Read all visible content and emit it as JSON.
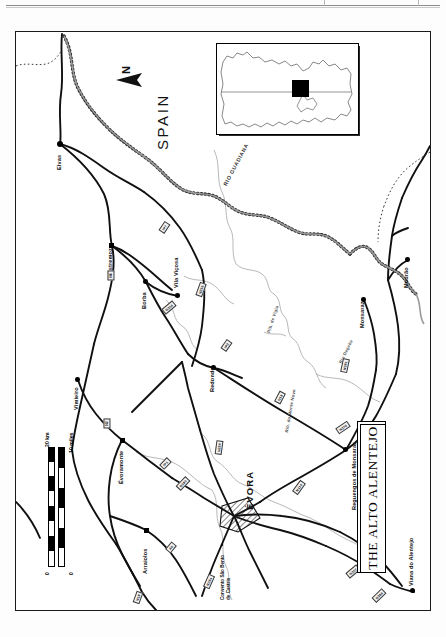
{
  "map": {
    "title": "THE ALTO ALENTEJO",
    "country_label": "SPAIN",
    "north_label": "N",
    "orientation_note": "map printed rotated 90 degrees",
    "towns": [
      {
        "name": "Elvas",
        "type": "city"
      },
      {
        "name": "Vila Viçosa",
        "type": "town"
      },
      {
        "name": "Borba",
        "type": "town"
      },
      {
        "name": "Estremoz",
        "type": "town"
      },
      {
        "name": "Redondo",
        "type": "town"
      },
      {
        "name": "Monsaraz",
        "type": "town"
      },
      {
        "name": "Reguengos de Monsaraz",
        "type": "town"
      },
      {
        "name": "Mourão",
        "type": "town"
      },
      {
        "name": "Vimieiro",
        "type": "town"
      },
      {
        "name": "Évoramonte",
        "type": "town"
      },
      {
        "name": "Arraiolos",
        "type": "town"
      },
      {
        "name": "ÉVORA",
        "type": "city-major"
      },
      {
        "name": "Viana do Alentejo",
        "type": "town"
      }
    ],
    "points_of_interest": [
      {
        "name_line1": "Convento São Bento",
        "name_line2": "de Castris"
      }
    ],
    "rivers": [
      {
        "name": "RIO GUADIANA"
      },
      {
        "name": "Rio Degebe"
      },
      {
        "name": "Rib. de Vigia"
      },
      {
        "name": "Rib. do Monte Novo"
      }
    ],
    "roads": [
      {
        "number": "IP7"
      },
      {
        "number": "N4"
      },
      {
        "number": "N254"
      },
      {
        "number": "N255"
      },
      {
        "number": "IP2"
      },
      {
        "number": "N18"
      },
      {
        "number": "N381"
      },
      {
        "number": "N370"
      },
      {
        "number": "N256"
      },
      {
        "number": "N114"
      },
      {
        "number": "IP1"
      },
      {
        "number": "N380"
      },
      {
        "number": "N2"
      },
      {
        "number": "A6"
      },
      {
        "number": "N18"
      },
      {
        "number": "N254"
      },
      {
        "number": "N257"
      },
      {
        "number": "N384"
      }
    ],
    "scale": {
      "km_label": "20 km",
      "miles_label": "10 miles",
      "zero_km": "0",
      "zero_mi": "0"
    },
    "inset": {
      "caption": ""
    }
  },
  "colors": {
    "ink": "#111111",
    "frame": "#1a1a1a",
    "river": "#9a9a9a",
    "paper": "#ffffff"
  }
}
